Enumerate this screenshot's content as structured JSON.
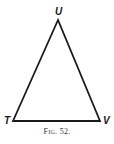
{
  "figure": {
    "caption": "Fig. 52.",
    "vertices": [
      {
        "name": "U",
        "x": 58,
        "y": 20
      },
      {
        "name": "T",
        "x": 13,
        "y": 121
      },
      {
        "name": "V",
        "x": 100,
        "y": 121
      }
    ],
    "labels": {
      "top": "U",
      "left": "T",
      "right": "V"
    },
    "stroke_color": "#1a1a1a"
  }
}
